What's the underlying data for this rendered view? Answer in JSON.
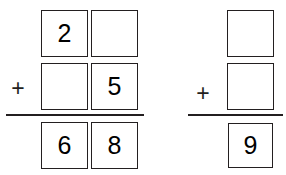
{
  "page": {
    "background_color": "#ffffff",
    "ink_color": "#231f20"
  },
  "problems": [
    {
      "id": "problem-1",
      "type": "vertical-addition",
      "operator": "+",
      "columns": [
        "tens",
        "ones"
      ],
      "addend1": {
        "tens": "2",
        "ones": ""
      },
      "addend2": {
        "tens": "",
        "ones": "5"
      },
      "sum": {
        "tens": "6",
        "ones": "8"
      },
      "blanks": [
        "addend1-ones",
        "addend2-tens"
      ],
      "equation_text": "2_ + _5 = 68"
    },
    {
      "id": "problem-2",
      "type": "vertical-addition",
      "operator": "+",
      "columns": [
        "ones"
      ],
      "addend1": {
        "ones": ""
      },
      "addend2": {
        "ones": ""
      },
      "sum": {
        "ones": "9"
      },
      "blanks": [
        "addend1-ones",
        "addend2-ones"
      ],
      "equation_text": "_ + _ = 9"
    }
  ]
}
